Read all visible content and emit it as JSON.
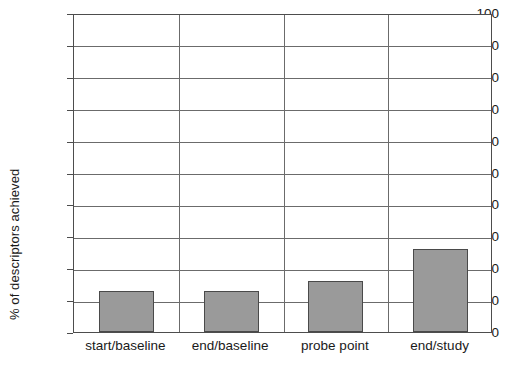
{
  "chart_data": {
    "type": "bar",
    "title": "",
    "subtitle": "",
    "xlabel": "",
    "ylabel": "% of descriptors achieved",
    "categories": [
      "start/baseline",
      "end/baseline",
      "probe point",
      "end/study"
    ],
    "values": [
      13,
      13,
      16,
      26
    ],
    "series": [
      {
        "name": "% of descriptors achieved",
        "values": [
          13,
          13,
          16,
          26
        ]
      }
    ],
    "ylim": [
      0,
      100
    ],
    "ytick_labels": [
      "0",
      "10",
      "20",
      "30",
      "40",
      "50",
      "60",
      "70",
      "80",
      "90",
      "100"
    ],
    "ytick_values": [
      0,
      10,
      20,
      30,
      40,
      50,
      60,
      70,
      80,
      90,
      100
    ],
    "grid": "horizontal-and-category-separators",
    "legend": "none",
    "legend_position": "none",
    "bar_color": "#9a9a9a",
    "bar_border_color": "#4a4a4a",
    "grid_color": "#6b6b6b",
    "axis_color": "#4d4d4d",
    "background_color": "#ffffff",
    "annotations": []
  }
}
